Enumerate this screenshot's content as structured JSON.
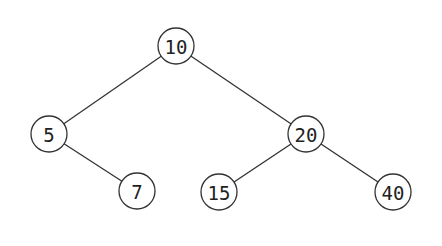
{
  "diagram": {
    "type": "binary-search-tree",
    "node_radius": 18,
    "colors": {
      "background": "#ffffff",
      "stroke": "#333333",
      "text": "#222222"
    },
    "nodes": [
      {
        "id": "n10",
        "label": "10",
        "x": 176,
        "y": 46
      },
      {
        "id": "n5",
        "label": "5",
        "x": 49,
        "y": 134
      },
      {
        "id": "n20",
        "label": "20",
        "x": 306,
        "y": 134
      },
      {
        "id": "n7",
        "label": "7",
        "x": 137,
        "y": 191
      },
      {
        "id": "n15",
        "label": "15",
        "x": 219,
        "y": 192
      },
      {
        "id": "n40",
        "label": "40",
        "x": 393,
        "y": 192
      }
    ],
    "edges": [
      {
        "from": "n10",
        "to": "n5"
      },
      {
        "from": "n10",
        "to": "n20"
      },
      {
        "from": "n5",
        "to": "n7"
      },
      {
        "from": "n20",
        "to": "n15"
      },
      {
        "from": "n20",
        "to": "n40"
      }
    ]
  }
}
